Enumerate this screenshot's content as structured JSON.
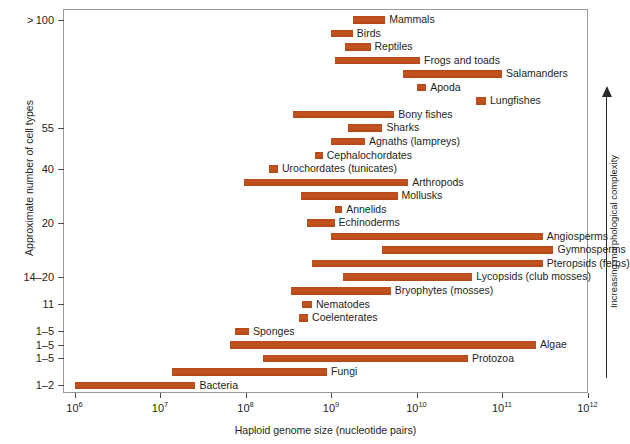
{
  "chart_data": {
    "type": "bar",
    "orientation": "horizontal",
    "title": "",
    "xlabel": "Haploid genome size (nucleotide pairs)",
    "ylabel": "Approximate number of cell types",
    "xscale": "log",
    "xlim": [
      1000000,
      1000000000000
    ],
    "grid": false,
    "legend": false,
    "xtick_labels": [
      "10⁶",
      "10⁷",
      "10⁸",
      "10⁹",
      "10¹⁰",
      "10¹¹",
      "10¹²"
    ],
    "xtick_bases": [
      "10",
      "10",
      "10",
      "10",
      "10",
      "10",
      "10"
    ],
    "xtick_exponents": [
      "6",
      "7",
      "8",
      "9",
      "10",
      "11",
      "12"
    ],
    "ytick_labels": [
      "> 100",
      "55",
      "40",
      "20",
      "14–20",
      "11",
      "1–5",
      "1–5",
      "1–5",
      "1–2"
    ],
    "annotation": "Increasing morphological complexity",
    "bar_color": "#c2521c",
    "categories": [
      "Mammals",
      "Birds",
      "Reptiles",
      "Frogs and toads",
      "Salamanders",
      "Apoda",
      "Lungfishes",
      "Bony fishes",
      "Sharks",
      "Agnaths (lampreys)",
      "Cephalochordates",
      "Urochordates (tunicates)",
      "Arthropods",
      "Mollusks",
      "Annelids",
      "Echinoderms",
      "Angiosperms",
      "Gymnosperms",
      "Pteropsids (ferns)",
      "Lycopsids (club mosses)",
      "Bryophytes (mosses)",
      "Nematodes",
      "Coelenterates",
      "Sponges",
      "Algae",
      "Protozoa",
      "Fungi",
      "Bacteria"
    ],
    "bars": [
      {
        "label": "Mammals",
        "x_start": 1800000000.0,
        "x_end": 4300000000.0
      },
      {
        "label": "Birds",
        "x_start": 1000000000.0,
        "x_end": 1800000000.0
      },
      {
        "label": "Reptiles",
        "x_start": 1450000000.0,
        "x_end": 2900000000.0
      },
      {
        "label": "Frogs and toads",
        "x_start": 1100000000.0,
        "x_end": 11000000000.0
      },
      {
        "label": "Salamanders",
        "x_start": 7000000000.0,
        "x_end": 100000000000.0
      },
      {
        "label": "Apoda",
        "x_start": 10000000000.0,
        "x_end": 13000000000.0
      },
      {
        "label": "Lungfishes",
        "x_start": 50000000000.0,
        "x_end": 65000000000.0
      },
      {
        "label": "Bony fishes",
        "x_start": 360000000.0,
        "x_end": 5500000000.0
      },
      {
        "label": "Sharks",
        "x_start": 1600000000.0,
        "x_end": 4000000000.0
      },
      {
        "label": "Agnaths (lampreys)",
        "x_start": 1000000000.0,
        "x_end": 2500000000.0
      },
      {
        "label": "Cephalochordates",
        "x_start": 650000000.0,
        "x_end": 800000000.0
      },
      {
        "label": "Urochordates (tunicates)",
        "x_start": 190000000.0,
        "x_end": 240000000.0
      },
      {
        "label": "Arthropods",
        "x_start": 95000000.0,
        "x_end": 8000000000.0
      },
      {
        "label": "Mollusks",
        "x_start": 450000000.0,
        "x_end": 6000000000.0
      },
      {
        "label": "Annelids",
        "x_start": 1100000000.0,
        "x_end": 1350000000.0
      },
      {
        "label": "Echinoderms",
        "x_start": 520000000.0,
        "x_end": 1100000000.0
      },
      {
        "label": "Angiosperms",
        "x_start": 1000000000.0,
        "x_end": 300000000000.0
      },
      {
        "label": "Gymnosperms",
        "x_start": 4000000000.0,
        "x_end": 400000000000.0
      },
      {
        "label": "Pteropsids (ferns)",
        "x_start": 600000000.0,
        "x_end": 300000000000.0
      },
      {
        "label": "Lycopsids (club mosses)",
        "x_start": 1400000000.0,
        "x_end": 45000000000.0
      },
      {
        "label": "Bryophytes (mosses)",
        "x_start": 340000000.0,
        "x_end": 5000000000.0
      },
      {
        "label": "Nematodes",
        "x_start": 460000000.0,
        "x_end": 600000000.0
      },
      {
        "label": "Coelenterates",
        "x_start": 420000000.0,
        "x_end": 540000000.0
      },
      {
        "label": "Sponges",
        "x_start": 75000000.0,
        "x_end": 110000000.0
      },
      {
        "label": "Algae",
        "x_start": 65000000.0,
        "x_end": 250000000000.0
      },
      {
        "label": "Protozoa",
        "x_start": 160000000.0,
        "x_end": 40000000000.0
      },
      {
        "label": "Fungi",
        "x_start": 14000000.0,
        "x_end": 900000000.0
      },
      {
        "label": "Bacteria",
        "x_start": 1000000.0,
        "x_end": 26000000.0
      }
    ]
  }
}
